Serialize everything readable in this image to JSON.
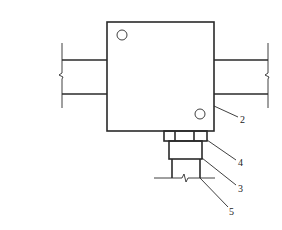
{
  "diagram": {
    "type": "technical-section-drawing",
    "colors": {
      "line": "#2a2a2a",
      "background": "#ffffff"
    },
    "callouts": [
      {
        "id": "2",
        "label": "2",
        "target": "main-box"
      },
      {
        "id": "4",
        "label": "4",
        "target": "nut-ring"
      },
      {
        "id": "3",
        "label": "3",
        "target": "threaded-body"
      },
      {
        "id": "5",
        "label": "5",
        "target": "stem-pipe"
      }
    ],
    "components": {
      "main_box": "square housing with two small circular holes",
      "left_beam": "horizontal member with break symbol",
      "right_beam": "horizontal member with break symbol",
      "nut_ring": "segmented collar below housing",
      "threaded_body": "rectangular body below collar",
      "stem_pipe": "vertical pipe with ground line break"
    }
  }
}
